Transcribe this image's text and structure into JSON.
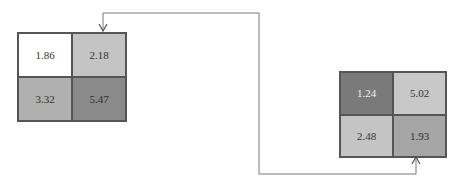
{
  "grids": [
    {
      "name": "left-matrix",
      "cells": [
        {
          "value": "1.86",
          "bg": "#ffffff",
          "fg": "#333333"
        },
        {
          "value": "2.18",
          "bg": "#c4c4c4",
          "fg": "#333333"
        },
        {
          "value": "3.32",
          "bg": "#b0b0b0",
          "fg": "#333333"
        },
        {
          "value": "5.47",
          "bg": "#8a8a8a",
          "fg": "#222222"
        }
      ]
    },
    {
      "name": "right-matrix",
      "cells": [
        {
          "value": "1.24",
          "bg": "#7a7a7a",
          "fg": "#f0f0f0"
        },
        {
          "value": "5.02",
          "bg": "#c8c8c8",
          "fg": "#333333"
        },
        {
          "value": "2.48",
          "bg": "#c4c4c4",
          "fg": "#333333"
        },
        {
          "value": "1.93",
          "bg": "#a5a5a5",
          "fg": "#333333"
        }
      ]
    }
  ],
  "connector": {
    "color": "#777777"
  }
}
